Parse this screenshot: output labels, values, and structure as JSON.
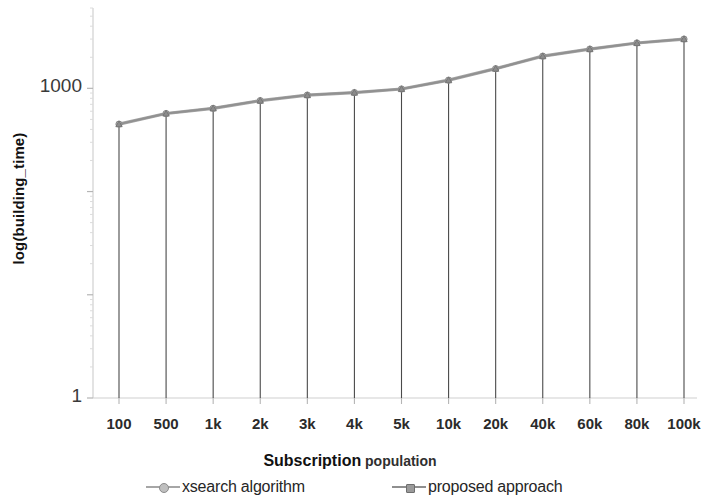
{
  "chart_data": {
    "type": "line",
    "title": "",
    "xlabel": "Subscription population",
    "xlabel_parts": {
      "strong": "Subscription",
      "light": " population"
    },
    "ylabel": "log(building_time)",
    "scale": {
      "y": "log"
    },
    "grid": false,
    "legend_position": "bottom",
    "ylim": [
      1,
      6000
    ],
    "y_tick_labels": [
      "1000",
      "1"
    ],
    "categories": [
      "100",
      "500",
      "1k",
      "2k",
      "3k",
      "4k",
      "5k",
      "10k",
      "20k",
      "40k",
      "60k",
      "80k",
      "100k"
    ],
    "series": [
      {
        "name": "xsearch algorithm",
        "color": "#a6a6a6",
        "marker": "circle",
        "values": [
          450,
          570,
          640,
          760,
          860,
          910,
          985,
          1200,
          1550,
          2050,
          2400,
          2750,
          3000
        ]
      },
      {
        "name": "proposed approach",
        "color": "#8f8f8f",
        "marker": "triangle",
        "values": [
          450,
          570,
          640,
          760,
          860,
          910,
          985,
          1200,
          1550,
          2050,
          2400,
          2750,
          3000
        ]
      }
    ],
    "annotations": [],
    "drop_lines": true
  },
  "legend": {
    "entries": [
      {
        "label": "xsearch algorithm"
      },
      {
        "label": "proposed approach"
      }
    ]
  },
  "colors": {
    "series_1": "#a6a6a6",
    "series_2": "#8f8f8f",
    "axis": "#d0d0d0",
    "drop_line": "#4a4a4a",
    "text": "#1a1a1a"
  }
}
